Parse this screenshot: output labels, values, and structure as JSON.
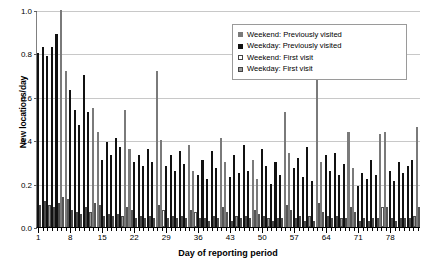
{
  "chart_data": {
    "type": "bar",
    "title": "",
    "xlabel": "Day of reporting period",
    "ylabel": "New locations/day",
    "ylim": [
      0,
      1.0
    ],
    "ytick_values": [
      "1.0",
      "0.8",
      "0.6",
      "0.4",
      "0.2",
      "0.0"
    ],
    "xtick_values": [
      "1",
      "8",
      "15",
      "22",
      "29",
      "36",
      "43",
      "50",
      "57",
      "64",
      "71",
      "78"
    ],
    "grid": true,
    "legend_position": "top-right",
    "stacked": true,
    "colors": {
      "prev_weekend": "#7a7a7a",
      "prev_weekday": "#111111",
      "first_weekend": "#ffffff",
      "first_weekday": "#9a9a9a",
      "gridline": "#c8c8c8",
      "axis": "#000000"
    },
    "legend": [
      {
        "label": "Weekend: Previously visited",
        "marker": "prev-weekend"
      },
      {
        "label": "Weekday: Previously visited",
        "marker": "prev-weekday"
      },
      {
        "label": "Weekend: First visit",
        "marker": "first-weekend"
      },
      {
        "label": "Weekday: First visit",
        "marker": "first-weekday"
      }
    ],
    "series": [
      {
        "name": "Previously visited",
        "key": "prev"
      },
      {
        "name": "First visit",
        "key": "first"
      }
    ],
    "days": [
      {
        "day": 1,
        "weekend": false,
        "prev": 0.8,
        "first": 0.1
      },
      {
        "day": 2,
        "weekend": false,
        "prev": 0.83,
        "first": 0.12
      },
      {
        "day": 3,
        "weekend": false,
        "prev": 0.79,
        "first": 0.1
      },
      {
        "day": 4,
        "weekend": false,
        "prev": 0.83,
        "first": 0.09
      },
      {
        "day": 5,
        "weekend": false,
        "prev": 0.89,
        "first": 0.11
      },
      {
        "day": 6,
        "weekend": true,
        "prev": 1.0,
        "first": 0.14
      },
      {
        "day": 7,
        "weekend": true,
        "prev": 0.72,
        "first": 0.13
      },
      {
        "day": 8,
        "weekend": false,
        "prev": 0.63,
        "first": 0.08
      },
      {
        "day": 9,
        "weekend": false,
        "prev": 0.54,
        "first": 0.07
      },
      {
        "day": 10,
        "weekend": false,
        "prev": 0.47,
        "first": 0.06
      },
      {
        "day": 11,
        "weekend": false,
        "prev": 0.7,
        "first": 0.09
      },
      {
        "day": 12,
        "weekend": false,
        "prev": 0.53,
        "first": 0.07
      },
      {
        "day": 13,
        "weekend": true,
        "prev": 0.55,
        "first": 0.11
      },
      {
        "day": 14,
        "weekend": true,
        "prev": 0.44,
        "first": 0.1
      },
      {
        "day": 15,
        "weekend": false,
        "prev": 0.31,
        "first": 0.05
      },
      {
        "day": 16,
        "weekend": false,
        "prev": 0.39,
        "first": 0.06
      },
      {
        "day": 17,
        "weekend": false,
        "prev": 0.33,
        "first": 0.05
      },
      {
        "day": 18,
        "weekend": false,
        "prev": 0.41,
        "first": 0.06
      },
      {
        "day": 19,
        "weekend": false,
        "prev": 0.37,
        "first": 0.05
      },
      {
        "day": 20,
        "weekend": true,
        "prev": 0.54,
        "first": 0.09
      },
      {
        "day": 21,
        "weekend": true,
        "prev": 0.36,
        "first": 0.08
      },
      {
        "day": 22,
        "weekend": false,
        "prev": 0.3,
        "first": 0.04
      },
      {
        "day": 23,
        "weekend": false,
        "prev": 0.33,
        "first": 0.05
      },
      {
        "day": 24,
        "weekend": false,
        "prev": 0.28,
        "first": 0.04
      },
      {
        "day": 25,
        "weekend": false,
        "prev": 0.36,
        "first": 0.05
      },
      {
        "day": 26,
        "weekend": false,
        "prev": 0.3,
        "first": 0.04
      },
      {
        "day": 27,
        "weekend": true,
        "prev": 0.72,
        "first": 0.1
      },
      {
        "day": 28,
        "weekend": true,
        "prev": 0.4,
        "first": 0.08
      },
      {
        "day": 29,
        "weekend": false,
        "prev": 0.28,
        "first": 0.04
      },
      {
        "day": 30,
        "weekend": false,
        "prev": 0.33,
        "first": 0.05
      },
      {
        "day": 31,
        "weekend": false,
        "prev": 0.26,
        "first": 0.04
      },
      {
        "day": 32,
        "weekend": false,
        "prev": 0.35,
        "first": 0.05
      },
      {
        "day": 33,
        "weekend": false,
        "prev": 0.29,
        "first": 0.04
      },
      {
        "day": 34,
        "weekend": true,
        "prev": 0.38,
        "first": 0.08
      },
      {
        "day": 35,
        "weekend": true,
        "prev": 0.26,
        "first": 0.07
      },
      {
        "day": 36,
        "weekend": false,
        "prev": 0.24,
        "first": 0.04
      },
      {
        "day": 37,
        "weekend": false,
        "prev": 0.31,
        "first": 0.04
      },
      {
        "day": 38,
        "weekend": false,
        "prev": 0.22,
        "first": 0.03
      },
      {
        "day": 39,
        "weekend": false,
        "prev": 0.35,
        "first": 0.05
      },
      {
        "day": 40,
        "weekend": false,
        "prev": 0.27,
        "first": 0.04
      },
      {
        "day": 41,
        "weekend": true,
        "prev": 0.41,
        "first": 0.09
      },
      {
        "day": 42,
        "weekend": true,
        "prev": 0.3,
        "first": 0.07
      },
      {
        "day": 43,
        "weekend": false,
        "prev": 0.23,
        "first": 0.03
      },
      {
        "day": 44,
        "weekend": false,
        "prev": 0.33,
        "first": 0.05
      },
      {
        "day": 45,
        "weekend": false,
        "prev": 0.25,
        "first": 0.04
      },
      {
        "day": 46,
        "weekend": false,
        "prev": 0.38,
        "first": 0.05
      },
      {
        "day": 47,
        "weekend": false,
        "prev": 0.26,
        "first": 0.04
      },
      {
        "day": 48,
        "weekend": true,
        "prev": 0.31,
        "first": 0.08
      },
      {
        "day": 49,
        "weekend": true,
        "prev": 0.22,
        "first": 0.06
      },
      {
        "day": 50,
        "weekend": false,
        "prev": 0.36,
        "first": 0.05
      },
      {
        "day": 51,
        "weekend": false,
        "prev": 0.28,
        "first": 0.04
      },
      {
        "day": 52,
        "weekend": false,
        "prev": 0.2,
        "first": 0.03
      },
      {
        "day": 53,
        "weekend": false,
        "prev": 0.3,
        "first": 0.04
      },
      {
        "day": 54,
        "weekend": false,
        "prev": 0.24,
        "first": 0.04
      },
      {
        "day": 55,
        "weekend": true,
        "prev": 0.53,
        "first": 0.1
      },
      {
        "day": 56,
        "weekend": true,
        "prev": 0.34,
        "first": 0.08
      },
      {
        "day": 57,
        "weekend": false,
        "prev": 0.27,
        "first": 0.04
      },
      {
        "day": 58,
        "weekend": false,
        "prev": 0.32,
        "first": 0.05
      },
      {
        "day": 59,
        "weekend": false,
        "prev": 0.23,
        "first": 0.03
      },
      {
        "day": 60,
        "weekend": false,
        "prev": 0.37,
        "first": 0.05
      },
      {
        "day": 61,
        "weekend": false,
        "prev": 0.21,
        "first": 0.03
      },
      {
        "day": 62,
        "weekend": true,
        "prev": 0.7,
        "first": 0.11
      },
      {
        "day": 63,
        "weekend": true,
        "prev": 0.3,
        "first": 0.07
      },
      {
        "day": 64,
        "weekend": false,
        "prev": 0.33,
        "first": 0.05
      },
      {
        "day": 65,
        "weekend": false,
        "prev": 0.26,
        "first": 0.04
      },
      {
        "day": 66,
        "weekend": false,
        "prev": 0.34,
        "first": 0.05
      },
      {
        "day": 67,
        "weekend": false,
        "prev": 0.24,
        "first": 0.04
      },
      {
        "day": 68,
        "weekend": false,
        "prev": 0.29,
        "first": 0.04
      },
      {
        "day": 69,
        "weekend": true,
        "prev": 0.44,
        "first": 0.09
      },
      {
        "day": 70,
        "weekend": true,
        "prev": 0.27,
        "first": 0.07
      },
      {
        "day": 71,
        "weekend": false,
        "prev": 0.19,
        "first": 0.03
      },
      {
        "day": 72,
        "weekend": false,
        "prev": 0.25,
        "first": 0.04
      },
      {
        "day": 73,
        "weekend": false,
        "prev": 0.22,
        "first": 0.03
      },
      {
        "day": 74,
        "weekend": false,
        "prev": 0.31,
        "first": 0.04
      },
      {
        "day": 75,
        "weekend": false,
        "prev": 0.24,
        "first": 0.04
      },
      {
        "day": 76,
        "weekend": true,
        "prev": 0.43,
        "first": 0.09
      },
      {
        "day": 77,
        "weekend": true,
        "prev": 0.44,
        "first": 0.09
      },
      {
        "day": 78,
        "weekend": false,
        "prev": 0.26,
        "first": 0.04
      },
      {
        "day": 79,
        "weekend": false,
        "prev": 0.21,
        "first": 0.03
      },
      {
        "day": 80,
        "weekend": false,
        "prev": 0.3,
        "first": 0.04
      },
      {
        "day": 81,
        "weekend": false,
        "prev": 0.25,
        "first": 0.04
      },
      {
        "day": 82,
        "weekend": false,
        "prev": 0.28,
        "first": 0.04
      },
      {
        "day": 83,
        "weekend": false,
        "prev": 0.31,
        "first": 0.05
      },
      {
        "day": 84,
        "weekend": true,
        "prev": 0.46,
        "first": 0.09
      }
    ]
  }
}
